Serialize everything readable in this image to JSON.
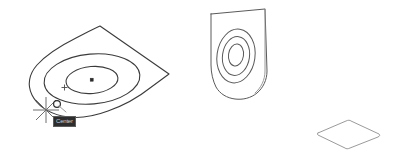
{
  "viewport": {
    "name": "cad-model-viewport",
    "background_color": "#ffffff",
    "width": 396,
    "height": 161
  },
  "style": {
    "wire_color": "#5a5a5a",
    "wire_dark_color": "#3b3b3b",
    "wire_thin_color": "#8e8e8e",
    "marker_color": "#4a4a4a",
    "snap_color": "#2e2e2e",
    "tooltip_background": "#2d2d2d",
    "tooltip_border": "#5c5c5c",
    "tooltip_text_color": "#cfcfcf"
  },
  "objects": [
    {
      "id": "main-plate",
      "label": "Kite plate with concentric bosses",
      "features": [
        "outer-boundary",
        "outer-circle",
        "inner-circle",
        "center-point-marker",
        "quadrant-cross-marker"
      ]
    },
    {
      "id": "upright-plate",
      "label": "Upright plate with concentric bosses",
      "features": [
        "outer-boundary",
        "outer-circle",
        "mid-circle",
        "inner-circle"
      ]
    },
    {
      "id": "flat-rect-plate",
      "label": "Flat rectangular plate",
      "features": [
        "outer-boundary"
      ]
    }
  ],
  "cursor": {
    "name": "crosshair-pickbox-cursor",
    "x": 46,
    "y": 110,
    "snap_marker": "center-snap-circle",
    "snap_marker_x": 57,
    "snap_marker_y": 104
  },
  "tooltip": {
    "name": "snap-tooltip",
    "text": "Center",
    "x": 53,
    "y": 116,
    "visible": true
  }
}
